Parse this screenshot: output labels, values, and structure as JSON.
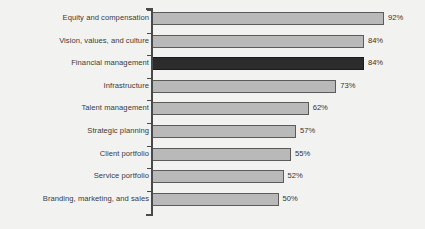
{
  "chart_data": {
    "type": "bar",
    "orientation": "horizontal",
    "title": "",
    "subtitle": "",
    "xlabel": "",
    "ylabel": "",
    "xlim": [
      0,
      100
    ],
    "grid": false,
    "legend": null,
    "value_suffix": "%",
    "colors": {
      "bar_fill": "#b9b9b9",
      "bar_border": "#5b5b5b",
      "highlight_fill": "#2c2c2c",
      "highlight_border": "#1b1b1b",
      "axis": "#4a4a4a",
      "background": "#f2f2f1",
      "label_text": "#3b3b3b",
      "value_text": "#333333"
    },
    "categories": [
      "Equity and compensation",
      "Vision, values, and culture",
      "Financial management",
      "Infrastructure",
      "Talent management",
      "Strategic planning",
      "Client portfolio",
      "Service portfolio",
      "Branding, marketing, and sales"
    ],
    "values": [
      92,
      84,
      84,
      73,
      62,
      57,
      55,
      52,
      50
    ],
    "value_labels": [
      "92%",
      "84%",
      "84%",
      "73%",
      "62%",
      "57%",
      "55%",
      "52%",
      "50%"
    ],
    "highlighted": [
      false,
      false,
      true,
      false,
      false,
      false,
      false,
      false,
      false
    ]
  }
}
